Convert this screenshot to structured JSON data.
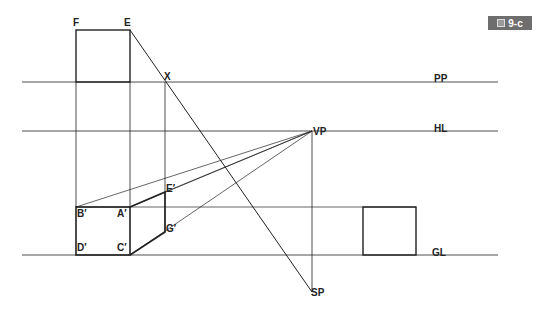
{
  "figure": {
    "badge_icon": "figure-icon",
    "badge_label": "9-c"
  },
  "lines": {
    "pp": "PP",
    "hl": "HL",
    "gl": "GL"
  },
  "points": {
    "F": "F",
    "E": "E",
    "X": "X",
    "VP": "VP",
    "SP": "SP",
    "B_prime": "B′",
    "A_prime": "A′",
    "E_prime": "E′",
    "G_prime": "G′",
    "D_prime": "D′",
    "C_prime": "C′"
  },
  "colors": {
    "line": "#222222",
    "badge_bg": "#6e6e6e"
  }
}
